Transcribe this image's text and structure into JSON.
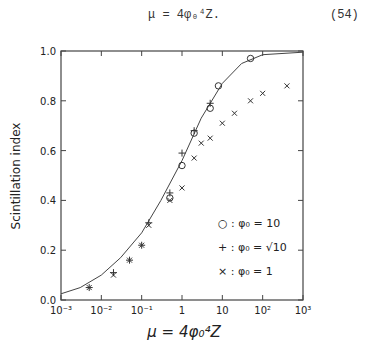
{
  "equation": {
    "text": "μ = 4φ₀⁴Z.",
    "number": "(54)"
  },
  "chart_data": {
    "type": "scatter",
    "title": "",
    "xlabel": "μ = 4φ₀⁴Z",
    "ylabel": "Scintillation index",
    "xscale": "log",
    "xlim": [
      0.001,
      1000
    ],
    "ylim": [
      0.0,
      1.0
    ],
    "xticks": [
      "10⁻³",
      "10⁻²",
      "10⁻¹",
      "1",
      "10",
      "10²",
      "10³"
    ],
    "yticks": [
      "0.0",
      "0.2",
      "0.4",
      "0.6",
      "0.8",
      "1.0"
    ],
    "legend_position": "lower right inside",
    "series": [
      {
        "name": "○ : φ₀ = 10",
        "marker": "circle",
        "x": [
          0.5,
          1.0,
          2.0,
          5.0,
          8.0,
          50.0
        ],
        "y": [
          0.41,
          0.54,
          0.67,
          0.77,
          0.86,
          0.97
        ]
      },
      {
        "name": "+ : φ₀ = √10",
        "marker": "plus",
        "x": [
          0.005,
          0.02,
          0.05,
          0.1,
          0.15,
          0.5,
          1.0,
          2.0,
          5.0
        ],
        "y": [
          0.05,
          0.11,
          0.16,
          0.22,
          0.31,
          0.43,
          0.59,
          0.68,
          0.79
        ]
      },
      {
        "name": "× : φ₀ = 1",
        "marker": "cross",
        "x": [
          0.005,
          0.02,
          0.05,
          0.1,
          0.15,
          0.5,
          1.0,
          2.0,
          3.0,
          5.0,
          10.0,
          20.0,
          50.0,
          100.0,
          400.0
        ],
        "y": [
          0.05,
          0.1,
          0.16,
          0.22,
          0.3,
          0.4,
          0.45,
          0.57,
          0.63,
          0.65,
          0.71,
          0.75,
          0.8,
          0.83,
          0.86
        ]
      },
      {
        "name": "theory curve",
        "marker": "line",
        "x": [
          0.001,
          0.003,
          0.01,
          0.03,
          0.1,
          0.3,
          1,
          3,
          10,
          30,
          100,
          1000
        ],
        "y": [
          0.025,
          0.05,
          0.1,
          0.17,
          0.27,
          0.4,
          0.56,
          0.73,
          0.87,
          0.95,
          0.985,
          0.995
        ]
      }
    ]
  }
}
